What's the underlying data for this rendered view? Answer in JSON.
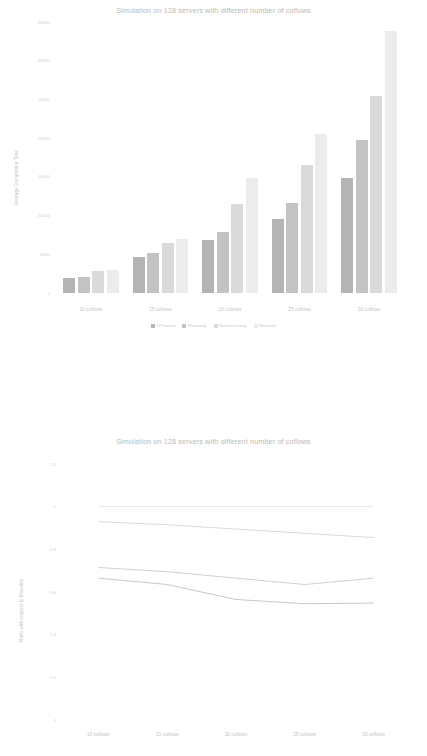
{
  "figures": {
    "bar": {
      "title": "Simulation on 128 servers with different number of coflows",
      "ylabel": "Average Completion Time",
      "yticks": [
        "35000",
        "30000",
        "25000",
        "20000",
        "15000",
        "10000",
        "5000",
        "0"
      ],
      "xticks": [
        "10 coflows",
        "15 coflows",
        "20 coflows",
        "25 coflows",
        "30 coflows"
      ],
      "legend": [
        "LP-based",
        "Flow-only",
        "Selection-only",
        "Baseline"
      ]
    },
    "line": {
      "title": "Simulation on 128 servers with different number of coflows",
      "ylabel": "Ratio with respect to Baseline",
      "yticks": [
        "1.2",
        "1",
        "0.8",
        "0.6",
        "0.4",
        "0.2",
        "0"
      ],
      "xticks": [
        "10 coflows",
        "15 coflows",
        "20 coflows",
        "25 coflows",
        "30 coflows"
      ]
    }
  },
  "chart_data": [
    {
      "type": "bar",
      "title": "Simulation on 128 servers with different number of coflows",
      "xlabel": "",
      "ylabel": "Average Completion Time",
      "categories": [
        "10 coflows",
        "15 coflows",
        "20 coflows",
        "25 coflows",
        "30 coflows"
      ],
      "ylim": [
        0,
        35000
      ],
      "ytick_values": [
        0,
        5000,
        10000,
        15000,
        20000,
        25000,
        30000,
        35000
      ],
      "grid": false,
      "legend_position": "bottom",
      "series": [
        {
          "name": "LP-based",
          "color": "#b4b4b4",
          "values": [
            2000,
            4700,
            6800,
            9600,
            14900
          ]
        },
        {
          "name": "Flow-only",
          "color": "#c3c3c3",
          "values": [
            2100,
            5200,
            7900,
            11600,
            19800
          ]
        },
        {
          "name": "Selection-only",
          "color": "#dadada",
          "values": [
            2800,
            6500,
            11500,
            16500,
            25500
          ]
        },
        {
          "name": "Baseline",
          "color": "#ececec",
          "values": [
            3000,
            7000,
            14900,
            20600,
            33800
          ]
        }
      ]
    },
    {
      "type": "line",
      "title": "Simulation on 128 servers with different number of coflows",
      "xlabel": "",
      "ylabel": "Ratio with respect to Baseline",
      "categories": [
        "10 coflows",
        "15 coflows",
        "20 coflows",
        "25 coflows",
        "30 coflows"
      ],
      "ylim": [
        0,
        1.2
      ],
      "ytick_values": [
        0,
        0.2,
        0.4,
        0.6,
        0.8,
        1.0,
        1.2
      ],
      "grid": false,
      "legend_position": "none",
      "series": [
        {
          "name": "Baseline",
          "color": "#e3e3e3",
          "values": [
            1.0,
            1.0,
            1.0,
            1.0,
            1.0
          ]
        },
        {
          "name": "Selection-only",
          "color": "#d6d6d6",
          "values": [
            0.93,
            0.915,
            0.895,
            0.875,
            0.855
          ]
        },
        {
          "name": "Flow-only",
          "color": "#c9c9c9",
          "values": [
            0.715,
            0.695,
            0.665,
            0.635,
            0.665
          ]
        },
        {
          "name": "LP-based",
          "color": "#c2c2c2",
          "values": [
            0.665,
            0.635,
            0.565,
            0.545,
            0.548
          ]
        }
      ]
    }
  ]
}
